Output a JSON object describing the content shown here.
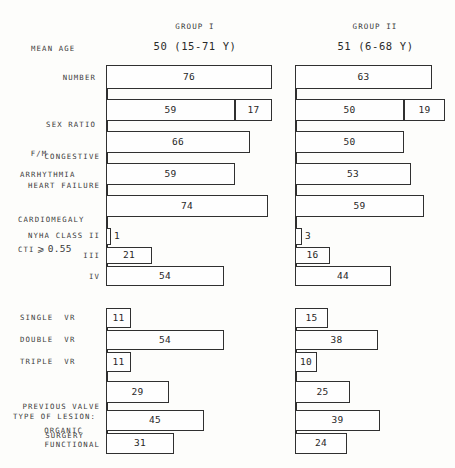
{
  "figure": {
    "scale_px_per_unit": 2.18,
    "groups": [
      {
        "key": "group1",
        "header": "GROUP I",
        "mean_age": "50 (15-71 Y)",
        "baseline_x": 106
      },
      {
        "key": "group2",
        "header": "GROUP II",
        "mean_age": "51 (6-68 Y)",
        "baseline_x": 295
      }
    ],
    "labels": {
      "mean_age": "MEAN AGE",
      "number": "NUMBER",
      "sex_ratio_1": "SEX RATIO",
      "sex_ratio_2": "F/M",
      "chf_1": "CONGESTIVE",
      "chf_2": "HEART FAILURE",
      "arrhythmia": "ARRHYTHMIA",
      "cardiomegaly_1": "CARDIOMEGALY",
      "cardiomegaly_2a": "CTI",
      "cardiomegaly_2b": "⩾",
      "cardiomegaly_2c": "0.55",
      "nyha_2": "NYHA CLASS II",
      "nyha_3": "III",
      "nyha_4": "IV",
      "single_vr": "SINGLE  VR",
      "double_vr": "DOUBLE  VR",
      "triple_vr": "TRIPLE  VR",
      "prev_valve_1": "PREVIOUS VALVE",
      "prev_valve_2": "SURGERY",
      "lesion_1": "TYPE OF LESION:",
      "lesion_2": "ORGANIC",
      "lesion_3": "FUNCTIONAL"
    }
  },
  "chart_data": {
    "type": "bar",
    "title": "",
    "xlabel": "",
    "ylabel": "",
    "orientation": "horizontal",
    "legend": [
      "GROUP I",
      "GROUP II"
    ],
    "annotations": {
      "group1_mean_age": "50 (15-71 Y)",
      "group2_mean_age": "51 (6-68 Y)"
    },
    "categories": [
      "NUMBER",
      "SEX RATIO F/M",
      "CONGESTIVE HEART FAILURE",
      "ARRHYTHMIA",
      "CARDIOMEGALY CTI ⩾ 0.55",
      "NYHA CLASS II",
      "NYHA CLASS III",
      "NYHA CLASS IV",
      "SINGLE VR",
      "DOUBLE VR",
      "TRIPLE VR",
      "PREVIOUS VALVE SURGERY",
      "TYPE OF LESION: ORGANIC",
      "TYPE OF LESION: FUNCTIONAL"
    ],
    "series": [
      {
        "name": "GROUP I",
        "values": [
          76,
          59,
          66,
          59,
          74,
          1,
          21,
          54,
          11,
          54,
          11,
          29,
          45,
          31
        ],
        "secondary": {
          "SEX RATIO F/M": 17
        }
      },
      {
        "name": "GROUP II",
        "values": [
          63,
          50,
          50,
          53,
          59,
          3,
          16,
          44,
          15,
          38,
          10,
          25,
          39,
          24
        ],
        "secondary": {
          "SEX RATIO F/M": 19
        }
      }
    ]
  },
  "rows": [
    {
      "y": 65,
      "h": 24,
      "g1": [
        {
          "v": "76",
          "w": 166
        }
      ],
      "g2": [
        {
          "v": "63",
          "w": 137
        }
      ]
    },
    {
      "y": 99,
      "h": 22,
      "g1": [
        {
          "v": "59",
          "w": 129
        },
        {
          "v": "17",
          "w": 37
        }
      ],
      "g2": [
        {
          "v": "50",
          "w": 109
        },
        {
          "v": "19",
          "w": 41
        }
      ]
    },
    {
      "y": 131,
      "h": 22,
      "g1": [
        {
          "v": "66",
          "w": 144
        }
      ],
      "g2": [
        {
          "v": "50",
          "w": 109
        }
      ]
    },
    {
      "y": 163,
      "h": 22,
      "g1": [
        {
          "v": "59",
          "w": 129
        }
      ],
      "g2": [
        {
          "v": "53",
          "w": 116
        }
      ]
    },
    {
      "y": 195,
      "h": 22,
      "g1": [
        {
          "v": "74",
          "w": 162
        }
      ],
      "g2": [
        {
          "v": "59",
          "w": 129
        }
      ]
    },
    {
      "y": 228,
      "h": 17,
      "g1": [
        {
          "v": "1",
          "w": 5,
          "out": true
        }
      ],
      "g2": [
        {
          "v": "3",
          "w": 7,
          "out": true
        }
      ]
    },
    {
      "y": 247,
      "h": 17,
      "g1": [
        {
          "v": "21",
          "w": 46
        }
      ],
      "g2": [
        {
          "v": "16",
          "w": 35
        }
      ]
    },
    {
      "y": 266,
      "h": 20,
      "g1": [
        {
          "v": "54",
          "w": 118
        }
      ],
      "g2": [
        {
          "v": "44",
          "w": 96
        }
      ]
    },
    {
      "y": 308,
      "h": 20,
      "g1": [
        {
          "v": "11",
          "w": 25
        }
      ],
      "g2": [
        {
          "v": "15",
          "w": 33
        }
      ]
    },
    {
      "y": 330,
      "h": 20,
      "g1": [
        {
          "v": "54",
          "w": 118
        }
      ],
      "g2": [
        {
          "v": "38",
          "w": 83
        }
      ]
    },
    {
      "y": 352,
      "h": 20,
      "g1": [
        {
          "v": "11",
          "w": 25
        }
      ],
      "g2": [
        {
          "v": "10",
          "w": 22
        }
      ]
    },
    {
      "y": 381,
      "h": 22,
      "g1": [
        {
          "v": "29",
          "w": 63
        }
      ],
      "g2": [
        {
          "v": "25",
          "w": 55
        }
      ]
    },
    {
      "y": 410,
      "h": 21,
      "g1": [
        {
          "v": "45",
          "w": 98
        }
      ],
      "g2": [
        {
          "v": "39",
          "w": 85
        }
      ]
    },
    {
      "y": 433,
      "h": 21,
      "g1": [
        {
          "v": "31",
          "w": 68
        }
      ],
      "g2": [
        {
          "v": "24",
          "w": 52
        }
      ]
    }
  ]
}
